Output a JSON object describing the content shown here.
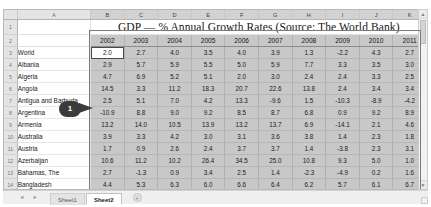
{
  "window": {
    "app": "spreadsheet"
  },
  "grid": {
    "column_letters": [
      "A",
      "B",
      "C",
      "D",
      "E",
      "F",
      "G",
      "H",
      "I",
      "J",
      "K"
    ],
    "row_numbers": [
      "1",
      "2",
      "3",
      "4",
      "5",
      "6",
      "7",
      "8",
      "9",
      "10",
      "11",
      "12",
      "13",
      "14",
      "15",
      "16"
    ],
    "title": "GDP — % Annual Growth Rates (Source: The World Bank)",
    "years": [
      "2002",
      "2003",
      "2004",
      "2005",
      "2006",
      "2007",
      "2008",
      "2009",
      "2010",
      "2011"
    ],
    "active_cell": "B3",
    "rows": [
      {
        "label": "World",
        "values": [
          "2.0",
          "2.7",
          "4.0",
          "3.5",
          "4.0",
          "3.9",
          "1.3",
          "-2.2",
          "4.3",
          "2.7"
        ]
      },
      {
        "label": "Albania",
        "values": [
          "2.9",
          "5.7",
          "5.9",
          "5.5",
          "5.0",
          "5.9",
          "7.7",
          "3.3",
          "3.5",
          "3.0"
        ]
      },
      {
        "label": "Algeria",
        "values": [
          "4.7",
          "6.9",
          "5.2",
          "5.1",
          "2.0",
          "3.0",
          "2.4",
          "2.4",
          "3.3",
          "2.5"
        ]
      },
      {
        "label": "Angola",
        "values": [
          "14.5",
          "3.3",
          "11.2",
          "18.3",
          "20.7",
          "22.6",
          "13.8",
          "2.4",
          "3.4",
          "3.4"
        ]
      },
      {
        "label": "Antigua and Barbuda",
        "values": [
          "2.5",
          "5.1",
          "7.0",
          "4.2",
          "13.3",
          "-9.6",
          "1.5",
          "-10.3",
          "-8.9",
          "-4.2"
        ]
      },
      {
        "label": "Argentina",
        "values": [
          "-10.9",
          "8.8",
          "9.0",
          "9.2",
          "8.5",
          "8.7",
          "6.8",
          "0.9",
          "9.2",
          "8.9"
        ]
      },
      {
        "label": "Armenia",
        "values": [
          "13.2",
          "14.0",
          "10.5",
          "13.9",
          "13.2",
          "13.7",
          "6.9",
          "-14.1",
          "2.1",
          "4.6"
        ]
      },
      {
        "label": "Australia",
        "values": [
          "3.9",
          "3.3",
          "4.2",
          "3.0",
          "3.1",
          "3.6",
          "3.8",
          "1.4",
          "2.3",
          "1.8"
        ]
      },
      {
        "label": "Austria",
        "values": [
          "1.7",
          "0.9",
          "2.6",
          "2.4",
          "3.7",
          "3.7",
          "1.4",
          "-3.8",
          "2.3",
          "3.1"
        ]
      },
      {
        "label": "Azerbaijan",
        "values": [
          "10.6",
          "11.2",
          "10.2",
          "26.4",
          "34.5",
          "25.0",
          "10.8",
          "9.3",
          "5.0",
          "1.0"
        ]
      },
      {
        "label": "Bahamas, The",
        "values": [
          "2.7",
          "-1.3",
          "0.9",
          "3.4",
          "2.5",
          "1.4",
          "-2.3",
          "-4.9",
          "0.2",
          "1.6"
        ]
      },
      {
        "label": "Bangladesh",
        "values": [
          "4.4",
          "5.3",
          "6.3",
          "6.0",
          "6.6",
          "6.4",
          "6.2",
          "5.7",
          "6.1",
          "6.7"
        ]
      },
      {
        "label": "Belarus",
        "values": [
          "5.0",
          "7.0",
          "11.4",
          "9.4",
          "10.0",
          "8.6",
          "10.2",
          "0.2",
          "7.7",
          "5.3"
        ]
      },
      {
        "label": "Belgium",
        "values": [
          "1.4",
          "0.8",
          "3.3",
          "1.8",
          "2.7",
          "2.9",
          "1.0",
          "-2.8",
          "2.2",
          "1.9"
        ]
      }
    ]
  },
  "callout": {
    "number": "1"
  },
  "scrollbar": {
    "up_arrow": "▲",
    "down_arrow": "▼"
  },
  "tabbar": {
    "nav_first": "◄",
    "nav_prev": "►",
    "tabs": [
      {
        "label": "Sheet1",
        "active": false
      },
      {
        "label": "Sheet2",
        "active": true
      }
    ],
    "add_sheet": "+"
  }
}
